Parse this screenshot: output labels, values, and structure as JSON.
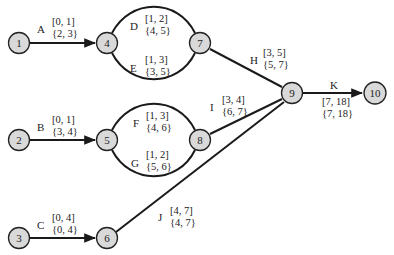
{
  "diagram": {
    "type": "activity-on-arrow network",
    "nodes": [
      {
        "id": "1",
        "label": "1"
      },
      {
        "id": "2",
        "label": "2"
      },
      {
        "id": "3",
        "label": "3"
      },
      {
        "id": "4",
        "label": "4"
      },
      {
        "id": "5",
        "label": "5"
      },
      {
        "id": "6",
        "label": "6"
      },
      {
        "id": "7",
        "label": "7"
      },
      {
        "id": "8",
        "label": "8"
      },
      {
        "id": "9",
        "label": "9"
      },
      {
        "id": "10",
        "label": "10"
      }
    ],
    "activities": [
      {
        "name": "A",
        "from": "1",
        "to": "4",
        "early": "[0, 1]",
        "late": "{2, 3}"
      },
      {
        "name": "B",
        "from": "2",
        "to": "5",
        "early": "[0, 1]",
        "late": "{3, 4}"
      },
      {
        "name": "C",
        "from": "3",
        "to": "6",
        "early": "[0, 4]",
        "late": "{0, 4}"
      },
      {
        "name": "D",
        "from": "4",
        "to": "7",
        "early": "[1, 2]",
        "late": "{4, 5}"
      },
      {
        "name": "E",
        "from": "4",
        "to": "7",
        "early": "[1, 3]",
        "late": "{3, 5}"
      },
      {
        "name": "F",
        "from": "5",
        "to": "8",
        "early": "[1, 3]",
        "late": "{4, 6}"
      },
      {
        "name": "G",
        "from": "5",
        "to": "8",
        "early": "[1, 2]",
        "late": "{5, 6}"
      },
      {
        "name": "H",
        "from": "7",
        "to": "9",
        "early": "[3, 5]",
        "late": "{5, 7}"
      },
      {
        "name": "I",
        "from": "8",
        "to": "9",
        "early": "[3, 4]",
        "late": "{6, 7}"
      },
      {
        "name": "J",
        "from": "6",
        "to": "9",
        "early": "[4, 7]",
        "late": "{4, 7}"
      },
      {
        "name": "K",
        "from": "9",
        "to": "10",
        "early": "[7, 18]",
        "late": "{7, 18}"
      }
    ]
  }
}
